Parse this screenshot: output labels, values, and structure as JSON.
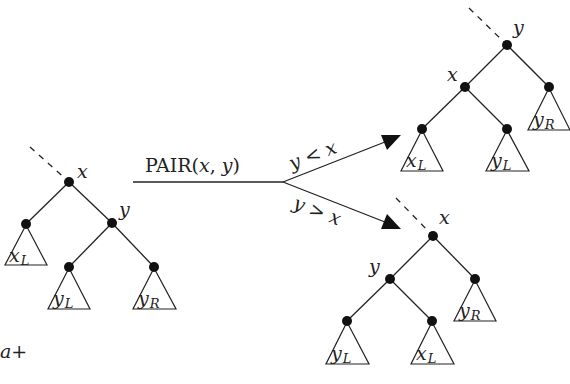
{
  "diagram": {
    "operation": {
      "name": "PAIR",
      "open": "(",
      "arg1": "x",
      "comma": ", ",
      "arg2": "y",
      "close": ")"
    },
    "branches": {
      "upper": {
        "lhs": "y",
        "op": "<",
        "rhs": "x"
      },
      "lower": {
        "lhs": "y",
        "op": ">",
        "rhs": "x"
      }
    },
    "input_tree": {
      "root": "x",
      "right_child": "y",
      "subtrees": [
        {
          "base": "x",
          "sub": "L"
        },
        {
          "base": "y",
          "sub": "L"
        },
        {
          "base": "y",
          "sub": "R"
        }
      ]
    },
    "output_tree_less": {
      "root": "y",
      "left_child": "x",
      "subtrees": [
        {
          "base": "x",
          "sub": "L"
        },
        {
          "base": "y",
          "sub": "L"
        },
        {
          "base": "y",
          "sub": "R"
        }
      ]
    },
    "output_tree_greater": {
      "root": "x",
      "left_child": "y",
      "subtrees": [
        {
          "base": "y",
          "sub": "L"
        },
        {
          "base": "x",
          "sub": "L"
        },
        {
          "base": "y",
          "sub": "R"
        }
      ]
    },
    "footer_fragment": {
      "var": "a",
      "sign": "+"
    }
  }
}
